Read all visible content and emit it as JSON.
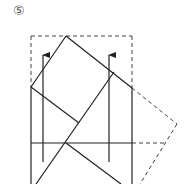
{
  "diagram": {
    "step_label": "⑤",
    "stroke_color": "#222222",
    "dashed_color": "#444444",
    "solid_lines": [
      {
        "name": "left-edge",
        "x1": 31,
        "y1": 87,
        "x2": 31,
        "y2": 184
      },
      {
        "name": "right-edge",
        "x1": 132,
        "y1": 88,
        "x2": 132,
        "y2": 184
      },
      {
        "name": "top-left-fold",
        "x1": 66,
        "y1": 36,
        "x2": 31,
        "y2": 87
      },
      {
        "name": "top-right-fold",
        "x1": 66,
        "y1": 36,
        "x2": 132,
        "y2": 88
      },
      {
        "name": "inner-left-diagonal",
        "x1": 31,
        "y1": 87,
        "x2": 79,
        "y2": 123
      },
      {
        "name": "long-diagonal",
        "x1": 36,
        "y1": 184,
        "x2": 114,
        "y2": 72
      },
      {
        "name": "lower-right-diagonal",
        "x1": 66,
        "y1": 143,
        "x2": 121,
        "y2": 184
      },
      {
        "name": "horizontal-crease",
        "x1": 31,
        "y1": 143,
        "x2": 132,
        "y2": 143
      }
    ],
    "dashed_lines": [
      {
        "name": "top-dashed",
        "x1": 31,
        "y1": 36,
        "x2": 132,
        "y2": 36
      },
      {
        "name": "left-dashed",
        "x1": 31,
        "y1": 36,
        "x2": 31,
        "y2": 87
      },
      {
        "name": "right-dashed",
        "x1": 132,
        "y1": 36,
        "x2": 132,
        "y2": 88
      },
      {
        "name": "flap-upper",
        "x1": 132,
        "y1": 88,
        "x2": 177,
        "y2": 124
      },
      {
        "name": "flap-horizontal",
        "x1": 132,
        "y1": 143,
        "x2": 165,
        "y2": 143
      },
      {
        "name": "flap-lower",
        "x1": 177,
        "y1": 124,
        "x2": 140,
        "y2": 184
      }
    ],
    "arrows": [
      {
        "name": "left-arrow",
        "x": 43,
        "y_top": 55,
        "y_bottom": 162
      },
      {
        "name": "right-arrow",
        "x": 109,
        "y_top": 55,
        "y_bottom": 162
      }
    ]
  }
}
